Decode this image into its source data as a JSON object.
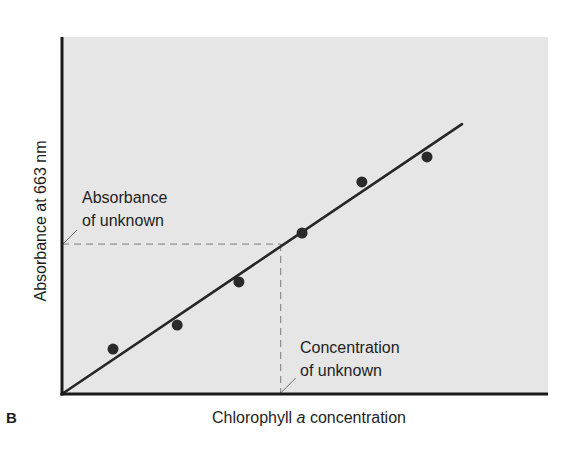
{
  "panel_label": "B",
  "chart_data": {
    "type": "scatter",
    "title": "",
    "xlabel": "Chlorophyll a concentration",
    "xlabel_parts": {
      "before": "Chlorophyll ",
      "italic": "a",
      "after": " concentration"
    },
    "ylabel": "Absorbance at 663 nm",
    "xlim": [
      0,
      10
    ],
    "ylim": [
      0,
      10
    ],
    "grid": false,
    "legend": null,
    "ticks": "none",
    "series": [
      {
        "name": "Standards",
        "kind": "points",
        "x": [
          1.05,
          2.37,
          3.64,
          4.94,
          6.17,
          7.51
        ],
        "y": [
          1.26,
          1.93,
          3.14,
          4.51,
          5.94,
          6.64
        ]
      },
      {
        "name": "Standard curve (linear fit)",
        "kind": "line",
        "x": [
          0,
          8.23
        ],
        "y": [
          0,
          7.56
        ]
      }
    ],
    "annotations": [
      {
        "id": "absorbance-unknown",
        "text_lines": [
          "Absorbance",
          "of unknown"
        ],
        "target": {
          "x": 0,
          "y": 4.2
        }
      },
      {
        "id": "concentration-unknown",
        "text_lines": [
          "Concentration",
          "of unknown"
        ],
        "target": {
          "x": 4.5,
          "y": 0
        }
      }
    ],
    "unknown_sample": {
      "x": 4.5,
      "y": 4.2
    }
  },
  "colors": {
    "plot_background": "#e6e6e6",
    "axis": "#1a1a1a",
    "line": "#262626",
    "points": "#2a2a2a",
    "dashed_guides": "#7a7a7a",
    "text": "#1e1e1e"
  }
}
